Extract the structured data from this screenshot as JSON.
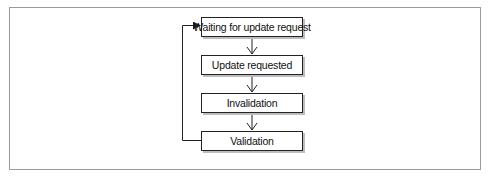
{
  "diagram": {
    "type": "state-cycle flowchart",
    "nodes": [
      {
        "id": "waiting",
        "label": "Waiting for update request"
      },
      {
        "id": "requested",
        "label": "Update requested"
      },
      {
        "id": "invalidation",
        "label": "Invalidation"
      },
      {
        "id": "validation",
        "label": "Validation"
      }
    ],
    "edges": [
      {
        "from": "waiting",
        "to": "requested"
      },
      {
        "from": "requested",
        "to": "invalidation"
      },
      {
        "from": "invalidation",
        "to": "validation"
      },
      {
        "from": "validation",
        "to": "waiting",
        "style": "loop-back-left"
      }
    ],
    "colors": {
      "line": "#222222",
      "frame": "#9a9a9a",
      "shadow": "#bdbdbd"
    }
  }
}
